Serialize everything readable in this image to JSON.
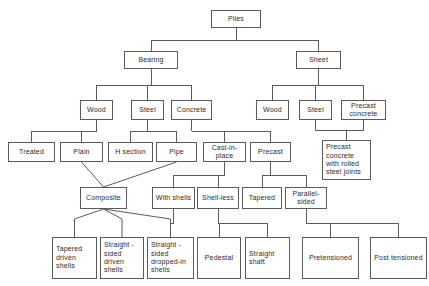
{
  "diagram": {
    "type": "hierarchy-flowchart",
    "line_color": "#5a5a5a",
    "box_fill": "#ffffff",
    "text_color": "#2b2b2b",
    "canvas": {
      "width": 429,
      "height": 286
    },
    "nodes": [
      {
        "id": "piles",
        "label": "Piles",
        "x": 211,
        "y": 10,
        "w": 50,
        "h": 18,
        "align": "center"
      },
      {
        "id": "bearing",
        "label": "Bearing",
        "x": 124,
        "y": 51,
        "w": 54,
        "h": 18,
        "align": "center"
      },
      {
        "id": "sheet",
        "label": "Sheet",
        "x": 296,
        "y": 51,
        "w": 45,
        "h": 18,
        "align": "center"
      },
      {
        "id": "wood-b",
        "label": "Wood",
        "x": 80,
        "y": 100,
        "w": 33,
        "h": 20,
        "align": "center"
      },
      {
        "id": "steel-b",
        "label": "Steel",
        "x": 131,
        "y": 100,
        "w": 33,
        "h": 20,
        "align": "center"
      },
      {
        "id": "concrete-b",
        "label": "Concrete",
        "x": 171,
        "y": 100,
        "w": 41,
        "h": 20,
        "align": "center"
      },
      {
        "id": "wood-s",
        "label": "Wood",
        "x": 256,
        "y": 100,
        "w": 33,
        "h": 20,
        "align": "center"
      },
      {
        "id": "steel-s",
        "label": "Steel",
        "x": 299,
        "y": 100,
        "w": 33,
        "h": 20,
        "align": "center"
      },
      {
        "id": "precast-concrete-s",
        "label": "Precast\nconcrete",
        "x": 341,
        "y": 100,
        "w": 45,
        "h": 20,
        "align": "center"
      },
      {
        "id": "treated",
        "label": "Treated",
        "x": 8,
        "y": 142,
        "w": 47,
        "h": 20,
        "align": "center"
      },
      {
        "id": "plain",
        "label": "Plain",
        "x": 60,
        "y": 142,
        "w": 43,
        "h": 20,
        "align": "center"
      },
      {
        "id": "h-section",
        "label": "H section",
        "x": 108,
        "y": 142,
        "w": 45,
        "h": 20,
        "align": "center"
      },
      {
        "id": "pipe",
        "label": "Pipe",
        "x": 156,
        "y": 142,
        "w": 41,
        "h": 20,
        "align": "center"
      },
      {
        "id": "cast-in-place",
        "label": "Cast-in-\nplace",
        "x": 203,
        "y": 142,
        "w": 43,
        "h": 20,
        "align": "center"
      },
      {
        "id": "precast-b",
        "label": "Precast",
        "x": 250,
        "y": 142,
        "w": 41,
        "h": 20,
        "align": "center"
      },
      {
        "id": "precast-rolled-joints",
        "label": "Precast\nconcrete\nwith rolled\nsteel joints",
        "x": 322,
        "y": 140,
        "w": 49,
        "h": 40,
        "align": "left"
      },
      {
        "id": "composite",
        "label": "Composite",
        "x": 80,
        "y": 187,
        "w": 47,
        "h": 22,
        "align": "center"
      },
      {
        "id": "with-shells",
        "label": "With shells",
        "x": 152,
        "y": 187,
        "w": 43,
        "h": 22,
        "align": "center"
      },
      {
        "id": "shell-less",
        "label": "Shell-less",
        "x": 197,
        "y": 187,
        "w": 42,
        "h": 22,
        "align": "center"
      },
      {
        "id": "tapered",
        "label": "Tapered",
        "x": 242,
        "y": 187,
        "w": 40,
        "h": 22,
        "align": "center"
      },
      {
        "id": "parallel-sided",
        "label": "Parallel-\nsided",
        "x": 285,
        "y": 187,
        "w": 42,
        "h": 22,
        "align": "center"
      },
      {
        "id": "tapered-driven-shells",
        "label": "Tapered\ndriven\nshells",
        "x": 52,
        "y": 237,
        "w": 45,
        "h": 42,
        "align": "left"
      },
      {
        "id": "straight-sided-driven-shells",
        "label": "Straight -\nsided\ndriven\nshells",
        "x": 100,
        "y": 237,
        "w": 44,
        "h": 42,
        "align": "left"
      },
      {
        "id": "straight-sided-dropped-in-shells",
        "label": "Straight -\nsided\ndropped-in\nshells",
        "x": 147,
        "y": 237,
        "w": 47,
        "h": 42,
        "align": "left"
      },
      {
        "id": "pedestal",
        "label": "Pedestal",
        "x": 197,
        "y": 237,
        "w": 44,
        "h": 42,
        "align": "center"
      },
      {
        "id": "straight-shaft",
        "label": "Straight\nshaft",
        "x": 245,
        "y": 237,
        "w": 45,
        "h": 42,
        "align": "left"
      },
      {
        "id": "pretensioned",
        "label": "Pretensioned",
        "x": 302,
        "y": 237,
        "w": 57,
        "h": 42,
        "align": "center"
      },
      {
        "id": "posttensioned",
        "label": "Post tensioned",
        "x": 370,
        "y": 237,
        "w": 57,
        "h": 42,
        "align": "center"
      }
    ],
    "edges": [
      {
        "from": "piles",
        "to": [
          "bearing",
          "sheet"
        ],
        "style": "orthogonal"
      },
      {
        "from": "bearing",
        "to": [
          "wood-b",
          "steel-b",
          "concrete-b"
        ],
        "style": "orthogonal"
      },
      {
        "from": "sheet",
        "to": [
          "wood-s",
          "steel-s",
          "precast-concrete-s"
        ],
        "style": "orthogonal"
      },
      {
        "from": "wood-b",
        "to": [
          "treated",
          "plain"
        ],
        "style": "orthogonal"
      },
      {
        "from": "steel-b",
        "to": [
          "h-section",
          "pipe"
        ],
        "style": "orthogonal"
      },
      {
        "from": "concrete-b",
        "to": [
          "cast-in-place",
          "precast-b"
        ],
        "style": "orthogonal"
      },
      {
        "from": "steel-s",
        "to": [
          "precast-rolled-joints"
        ],
        "style": "orthogonal"
      },
      {
        "from": "precast-concrete-s",
        "to": [
          "precast-rolled-joints"
        ],
        "style": "orthogonal"
      },
      {
        "from": "plain",
        "to": [
          "composite"
        ],
        "style": "diagonal"
      },
      {
        "from": "pipe",
        "to": [
          "composite"
        ],
        "style": "diagonal"
      },
      {
        "from": "cast-in-place",
        "to": [
          "with-shells",
          "shell-less"
        ],
        "style": "orthogonal"
      },
      {
        "from": "precast-b",
        "to": [
          "tapered",
          "parallel-sided"
        ],
        "style": "orthogonal"
      },
      {
        "from": "composite",
        "to": [
          "tapered-driven-shells",
          "straight-sided-driven-shells",
          "straight-sided-dropped-in-shells"
        ],
        "style": "diagonal"
      },
      {
        "from": "with-shells",
        "to": [
          "straight-sided-dropped-in-shells"
        ],
        "style": "orthogonal"
      },
      {
        "from": "shell-less",
        "to": [
          "pedestal",
          "straight-shaft"
        ],
        "style": "orthogonal"
      },
      {
        "from": "parallel-sided",
        "to": [
          "pretensioned",
          "posttensioned"
        ],
        "style": "orthogonal"
      }
    ]
  }
}
